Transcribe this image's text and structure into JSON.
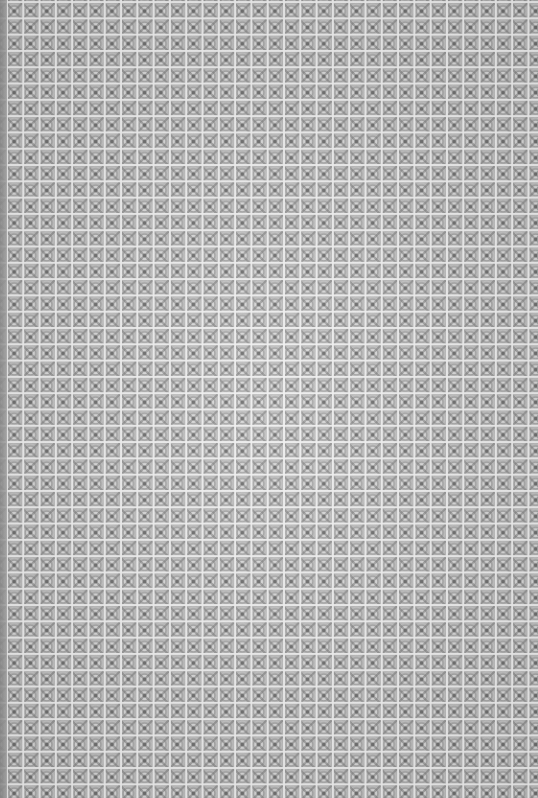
{
  "image": {
    "description": "Grayscale repeating tiled ornamental pattern texture",
    "tile_period_px": 16.3,
    "columns_approx": 33,
    "rows_approx": 49,
    "colors": {
      "background": "#b8b8b8",
      "grid_lines": "#f0f0f0",
      "motif_dark": "#6e6e6e",
      "left_edge": "#8c8c8c"
    }
  }
}
